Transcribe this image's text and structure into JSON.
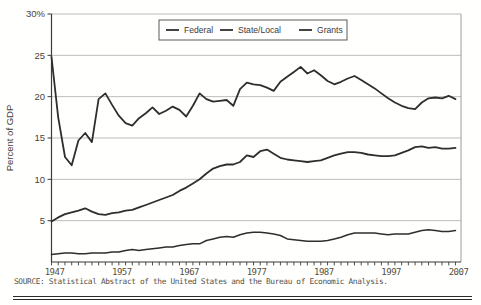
{
  "figure": {
    "ylabel": "Percent of GDP",
    "source": "SOURCE: Statistical Abstract of the United States and the Bureau of Economic Analysis.",
    "colors": {
      "line": "#2e2e2c",
      "gridline": "#bcbcba",
      "axis": "#3b3b39",
      "frame": "#9c9c9a",
      "tick_label": "#55503f",
      "background": "#fffffe"
    }
  },
  "chart_data": {
    "type": "line",
    "title": "",
    "xlabel": "",
    "ylabel": "Percent of GDP",
    "ylim": [
      0,
      30
    ],
    "xlim": [
      1947,
      2008
    ],
    "grid": "horizontal",
    "legend_position": "top-center",
    "y_ticks": [
      {
        "v": 30,
        "label": "30%"
      },
      {
        "v": 25,
        "label": "25"
      },
      {
        "v": 20,
        "label": "20"
      },
      {
        "v": 15,
        "label": "15"
      },
      {
        "v": 10,
        "label": "10"
      },
      {
        "v": 5,
        "label": "5"
      }
    ],
    "x_ticks": [
      1947,
      1957,
      1967,
      1977,
      1987,
      1997,
      2007
    ],
    "x": [
      1947,
      1948,
      1949,
      1950,
      1951,
      1952,
      1953,
      1954,
      1955,
      1956,
      1957,
      1958,
      1959,
      1960,
      1961,
      1962,
      1963,
      1964,
      1965,
      1966,
      1967,
      1968,
      1969,
      1970,
      1971,
      1972,
      1973,
      1974,
      1975,
      1976,
      1977,
      1978,
      1979,
      1980,
      1981,
      1982,
      1983,
      1984,
      1985,
      1986,
      1987,
      1988,
      1989,
      1990,
      1991,
      1992,
      1993,
      1994,
      1995,
      1996,
      1997,
      1998,
      1999,
      2000,
      2001,
      2002,
      2003,
      2004,
      2005,
      2006,
      2007
    ],
    "series": [
      {
        "name": "Federal",
        "values": [
          24.8,
          17.5,
          12.7,
          11.7,
          14.7,
          15.6,
          14.5,
          19.7,
          20.4,
          19.0,
          17.7,
          16.8,
          16.5,
          17.4,
          18.0,
          18.7,
          17.9,
          18.3,
          18.8,
          18.4,
          17.6,
          18.9,
          20.4,
          19.7,
          19.4,
          19.5,
          19.6,
          18.9,
          20.9,
          21.7,
          21.5,
          21.4,
          21.1,
          20.7,
          21.8,
          22.4,
          23.0,
          23.6,
          22.8,
          23.2,
          22.6,
          21.9,
          21.5,
          21.8,
          22.2,
          22.5,
          22.0,
          21.5,
          21.0,
          20.4,
          19.8,
          19.3,
          18.9,
          18.6,
          18.5,
          19.3,
          19.8,
          19.9,
          19.8,
          20.1,
          19.7
        ]
      },
      {
        "name": "State/Local",
        "values": [
          4.9,
          5.4,
          5.8,
          6.0,
          6.2,
          6.5,
          6.1,
          5.8,
          5.7,
          5.9,
          6.0,
          6.2,
          6.3,
          6.6,
          6.9,
          7.2,
          7.5,
          7.8,
          8.1,
          8.6,
          9.0,
          9.5,
          10.0,
          10.7,
          11.3,
          11.6,
          11.8,
          11.8,
          12.1,
          12.9,
          12.7,
          13.4,
          13.6,
          13.1,
          12.6,
          12.4,
          12.3,
          12.2,
          12.1,
          12.2,
          12.3,
          12.6,
          12.9,
          13.1,
          13.3,
          13.3,
          13.2,
          13.0,
          12.9,
          12.8,
          12.8,
          12.9,
          13.2,
          13.5,
          13.9,
          14.0,
          13.8,
          13.9,
          13.7,
          13.7,
          13.8
        ]
      },
      {
        "name": "Grants",
        "values": [
          0.9,
          1.0,
          1.1,
          1.1,
          1.0,
          1.0,
          1.1,
          1.1,
          1.1,
          1.2,
          1.2,
          1.4,
          1.5,
          1.4,
          1.5,
          1.6,
          1.7,
          1.8,
          1.8,
          2.0,
          2.1,
          2.2,
          2.2,
          2.6,
          2.8,
          3.0,
          3.1,
          3.0,
          3.3,
          3.5,
          3.6,
          3.6,
          3.5,
          3.4,
          3.2,
          2.8,
          2.7,
          2.6,
          2.5,
          2.5,
          2.5,
          2.6,
          2.8,
          3.0,
          3.3,
          3.5,
          3.5,
          3.5,
          3.5,
          3.4,
          3.3,
          3.4,
          3.4,
          3.4,
          3.6,
          3.8,
          3.9,
          3.8,
          3.7,
          3.7,
          3.8
        ]
      }
    ]
  }
}
